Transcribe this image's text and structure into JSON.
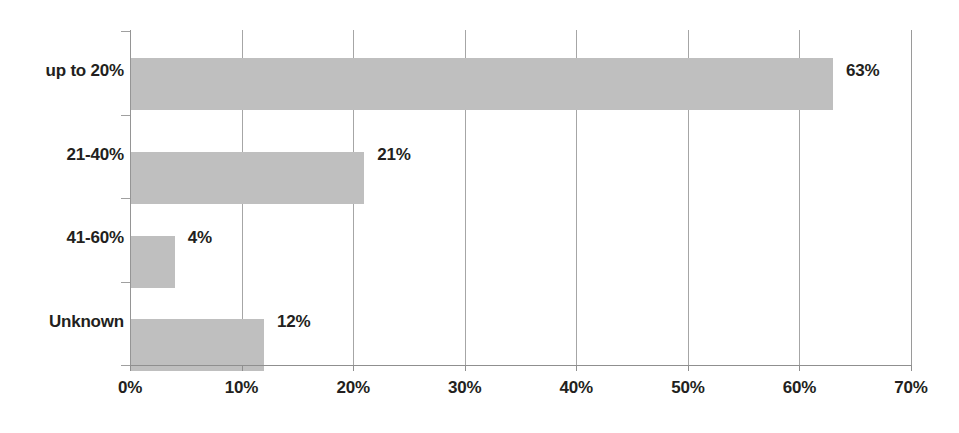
{
  "chart_data": {
    "type": "bar",
    "orientation": "horizontal",
    "title": "",
    "xlabel": "",
    "ylabel": "",
    "categories": [
      "up to 20%",
      "21-40%",
      "41-60%",
      "Unknown"
    ],
    "values": [
      63,
      21,
      4,
      12
    ],
    "data_labels": [
      "63%",
      "21%",
      "4%",
      "12%"
    ],
    "xlim": [
      0,
      70
    ],
    "xticks": [
      0,
      10,
      20,
      30,
      40,
      50,
      60,
      70
    ],
    "xtick_labels": [
      "0%",
      "10%",
      "20%",
      "30%",
      "40%",
      "50%",
      "60%",
      "70%"
    ],
    "grid": "vertical",
    "legend": null,
    "series": [
      {
        "name": "share",
        "values": [
          63,
          21,
          4,
          12
        ]
      }
    ],
    "colors": {
      "bar_fill": "#bfbfbf",
      "gridline": "#a6a6a6",
      "axis": "#8f8f8f",
      "text": "#231f20",
      "background": "#ffffff"
    }
  }
}
